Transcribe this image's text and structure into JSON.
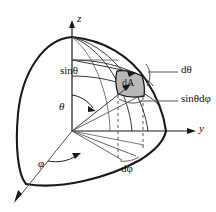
{
  "figure": {
    "type": "spherical-coordinates-diagram",
    "background_color": "#ffffff",
    "line_color": "#1a1a1a",
    "thin_line_color": "#555555",
    "patch_fill_color": "#b8b8b8",
    "axes": {
      "z_label": "z",
      "y_label": "y",
      "x_label": ""
    },
    "angles": {
      "theta_label": "θ",
      "phi_label": "φ"
    },
    "labels": {
      "sin_theta": "sinθ",
      "d_theta": "dθ",
      "d_phi": "dφ",
      "sin_theta_d_phi": "sinθdφ",
      "area_element": "dA"
    },
    "geometry": {
      "origin": [
        72,
        131
      ],
      "north_pole": [
        72,
        37
      ],
      "z_axis_tip": [
        72,
        22
      ],
      "y_axis_tip": [
        196,
        131
      ],
      "x_axis_tip": [
        14,
        201
      ],
      "sphere_right_edge_x": 166,
      "sphere_left_edge_x": 14,
      "patch_center": [
        131,
        84
      ],
      "radius_ring_y": 60
    }
  }
}
